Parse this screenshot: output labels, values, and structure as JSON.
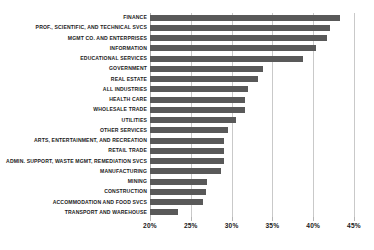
{
  "chart_data": {
    "type": "bar",
    "orientation": "horizontal",
    "title": "",
    "subtitle": "",
    "xlabel": "",
    "ylabel": "",
    "xlim": [
      20,
      45
    ],
    "ylim": null,
    "grid": "vertical",
    "legend": null,
    "legend_position": "none",
    "bar_color": "#595959",
    "gridline_color": "#c9c9c9",
    "xticks": [
      20,
      25,
      30,
      35,
      40,
      45
    ],
    "xticklabels": [
      "20%",
      "25%",
      "30%",
      "35%",
      "40%",
      "45%"
    ],
    "categories": [
      "FINANCE",
      "PROF., SCIENTIFIC, AND TECHNICAL SVCS",
      "MGMT CO. AND ENTERPRISES",
      "INFORMATION",
      "EDUCATIONAL SERVICES",
      "GOVERNMENT",
      "REAL ESTATE",
      "ALL INDUSTRIES",
      "HEALTH CARE",
      "WHOLESALE TRADE",
      "UTILITIES",
      "OTHER SERVICES",
      "ARTS, ENTERTAINMENT, AND RECREATION",
      "RETAIL TRADE",
      "ADMIN. SUPPORT, WASTE MGMT, REMEDIATION SVCS",
      "MANUFACTURING",
      "MINING",
      "CONSTRUCTION",
      "ACCOMMODATION AND FOOD SVCS",
      "TRANSPORT AND WAREHOUSE"
    ],
    "values": [
      43.3,
      42.0,
      41.7,
      40.4,
      38.7,
      33.9,
      33.2,
      32.0,
      31.7,
      31.7,
      30.5,
      29.6,
      29.1,
      29.1,
      29.1,
      28.7,
      27.0,
      26.9,
      26.5,
      23.4
    ]
  }
}
